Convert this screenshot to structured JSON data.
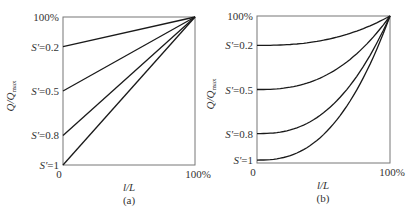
{
  "chart_data": [
    {
      "type": "line",
      "panel": "(a)",
      "caption": "(a)",
      "xlabel": "l/L",
      "ylabel": "Q/Q_max",
      "ylabel_main": "Q/Q",
      "ylabel_sub": "max",
      "x_ticks": [
        "0",
        "100%"
      ],
      "y_top_tick": "100%",
      "xlim": [
        0,
        1
      ],
      "ylim": [
        0,
        1
      ],
      "grid": false,
      "curve_shape": "linear",
      "x": [
        0,
        1
      ],
      "series": [
        {
          "name": "S'=0.2",
          "label": "S′=0.2",
          "values": [
            0.8,
            1.0
          ]
        },
        {
          "name": "S'=0.5",
          "label": "S′=0.5",
          "values": [
            0.5,
            1.0
          ]
        },
        {
          "name": "S'=0.8",
          "label": "S′=0.8",
          "values": [
            0.2,
            1.0
          ]
        },
        {
          "name": "S'=1",
          "label": "S′=1",
          "values": [
            0.0,
            1.0
          ]
        }
      ]
    },
    {
      "type": "line",
      "panel": "(b)",
      "caption": "(b)",
      "xlabel": "l/L",
      "ylabel": "Q/Q_max",
      "ylabel_main": "Q/Q",
      "ylabel_sub": "max",
      "x_ticks": [
        "0",
        "100%"
      ],
      "y_top_tick": "100%",
      "xlim": [
        0,
        1
      ],
      "ylim": [
        0,
        1
      ],
      "grid": false,
      "curve_shape": "convex",
      "x": [
        0,
        0.25,
        0.5,
        0.75,
        1
      ],
      "series": [
        {
          "name": "S'=0.2",
          "label": "S′=0.2",
          "values": [
            0.8,
            0.81,
            0.84,
            0.9,
            1.0
          ]
        },
        {
          "name": "S'=0.5",
          "label": "S′=0.5",
          "values": [
            0.5,
            0.52,
            0.59,
            0.74,
            1.0
          ]
        },
        {
          "name": "S'=0.8",
          "label": "S′=0.8",
          "values": [
            0.2,
            0.22,
            0.34,
            0.59,
            1.0
          ]
        },
        {
          "name": "S'=1",
          "label": "S′=1",
          "values": [
            0.02,
            0.04,
            0.16,
            0.49,
            1.0
          ]
        }
      ]
    }
  ],
  "style": {
    "line_color": "#1a1a1a",
    "axis_color": "#555555",
    "text_color": "#333333"
  }
}
